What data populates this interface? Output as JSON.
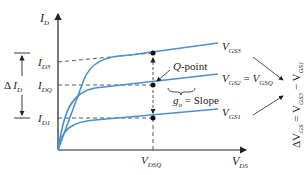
{
  "diagram": {
    "axes": {
      "y_label": {
        "main": "I",
        "sub": "D"
      },
      "x_label": {
        "main": "V",
        "sub": "DS"
      }
    },
    "levels": [
      {
        "main": "I",
        "sub": "D3"
      },
      {
        "main": "I",
        "sub": "DQ"
      },
      {
        "main": "I",
        "sub": "D1"
      }
    ],
    "x_marker": {
      "main": "V",
      "sub": "DSQ"
    },
    "delta_id": {
      "prefix": "Δ ",
      "main": "I",
      "sub": "D"
    },
    "curves": [
      {
        "main": "V",
        "sub": "GS3",
        "suffix": ""
      },
      {
        "main": "V",
        "sub": "GS2",
        "eq": " = ",
        "main2": "V",
        "sub2": "GSQ"
      },
      {
        "main": "V",
        "sub": "GS1",
        "suffix": ""
      }
    ],
    "q_point_label": "Q",
    "q_point_suffix": "-point",
    "slope_label": {
      "main": "g",
      "sub": "o",
      "rest": " = Slope"
    },
    "delta_vgs": {
      "prefix": "ΔV",
      "sub1": "GS",
      "eq": " = V",
      "sub2": "GS3",
      "minus": " − V",
      "sub3": "GS1"
    },
    "colors": {
      "curve": "#4a90cf",
      "axis": "#222222",
      "dash": "#444444"
    }
  }
}
